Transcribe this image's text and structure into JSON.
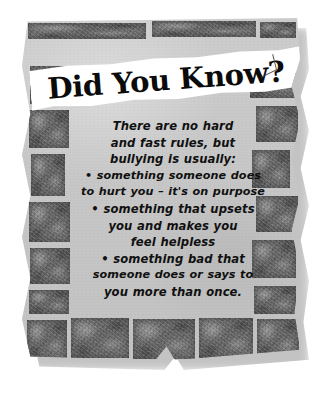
{
  "poster": {
    "headline": "Did You Know?",
    "colors": {
      "background": "#ffffff",
      "panel": "#c8c8c8",
      "brick": "#6a6a6a",
      "banner": "#ffffff",
      "text": "#101010"
    },
    "body_lines": [
      "There are no hard",
      "and fast rules, but",
      "bullying is usually:",
      "• something someone does",
      "to hurt you – it's on purpose",
      "• something that upsets",
      "you and makes you",
      "feel helpless",
      "• something bad that",
      "someone does or says to",
      "you more than once."
    ]
  }
}
